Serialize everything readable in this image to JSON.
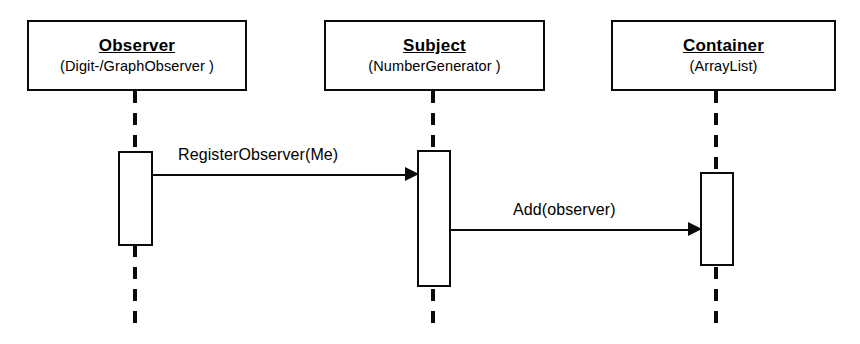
{
  "diagram": {
    "kind": "uml-sequence-diagram",
    "background_color": "#ffffff",
    "stroke_color": "#0b0b0b"
  },
  "participants": [
    {
      "id": "observer",
      "name": "Observer",
      "type": "(Digit-/GraphObserver )",
      "box": {
        "x": 27,
        "y": 20,
        "width": 220,
        "height": 71
      },
      "lifeline_x": 135,
      "activation": {
        "x": 118,
        "y": 151,
        "width": 35,
        "height": 95
      }
    },
    {
      "id": "subject",
      "name": "Subject",
      "type": "(NumberGenerator )",
      "box": {
        "x": 324,
        "y": 20,
        "width": 221,
        "height": 71
      },
      "lifeline_x": 433,
      "activation": {
        "x": 417,
        "y": 150,
        "width": 34,
        "height": 137
      }
    },
    {
      "id": "container",
      "name": "Container",
      "type": "(ArrayList)",
      "box": {
        "x": 611,
        "y": 20,
        "width": 225,
        "height": 71
      },
      "lifeline_x": 716,
      "activation": {
        "x": 700,
        "y": 172,
        "width": 34,
        "height": 94
      }
    }
  ],
  "messages": [
    {
      "id": "register-observer",
      "label": "RegisterObserver(Me)",
      "from": "observer",
      "to": "subject",
      "line": {
        "x": 153,
        "y": 174,
        "width": 252
      },
      "arrowhead": {
        "x": 405,
        "y": 167
      },
      "label_pos": {
        "x": 178,
        "y": 146
      }
    },
    {
      "id": "add-observer",
      "label": "Add(observer)",
      "from": "subject",
      "to": "container",
      "line": {
        "x": 450,
        "y": 229,
        "width": 238
      },
      "arrowhead": {
        "x": 688,
        "y": 222
      },
      "label_pos": {
        "x": 513,
        "y": 201
      }
    }
  ]
}
